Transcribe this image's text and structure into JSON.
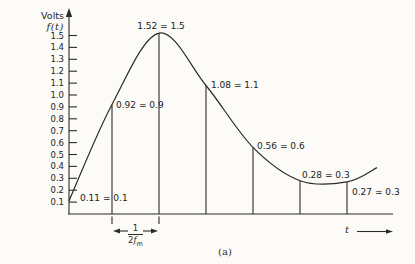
{
  "figure": {
    "y_axis_unit": "Volts",
    "y_axis_function": "f(t)",
    "x_axis_label": "t",
    "caption": "(a)",
    "interval": {
      "numerator": "1",
      "den_coeff": "2",
      "den_var": "f",
      "den_sub": "m"
    }
  },
  "colors": {
    "ink": "#2b2b2b",
    "paper": "#fcfbf8"
  },
  "chart_data": {
    "type": "line",
    "title": "",
    "xlabel": "t",
    "ylabel": "Volts f(t)",
    "ylim": [
      0,
      1.6
    ],
    "grid": false,
    "y_ticks": [
      0.1,
      0.2,
      0.3,
      0.4,
      0.5,
      0.6,
      0.7,
      0.8,
      0.9,
      1.0,
      1.1,
      1.2,
      1.3,
      1.4,
      1.5
    ],
    "samples": [
      {
        "value": 0.11,
        "approx": 0.1,
        "label": "0.11 ≃ 0.1"
      },
      {
        "value": 0.92,
        "approx": 0.9,
        "label": "0.92 ≃ 0.9"
      },
      {
        "value": 1.52,
        "approx": 1.5,
        "label": "1.52 ≃ 1.5"
      },
      {
        "value": 1.08,
        "approx": 1.1,
        "label": "1.08 ≃ 1.1"
      },
      {
        "value": 0.56,
        "approx": 0.6,
        "label": "0.56 ≃ 0.6"
      },
      {
        "value": 0.28,
        "approx": 0.3,
        "label": "0.28 ≃ 0.3"
      },
      {
        "value": 0.27,
        "approx": 0.3,
        "label": "0.27 ≃ 0.3"
      }
    ],
    "sampling_interval": "1/(2fm)",
    "curve_tail_value": 0.39
  }
}
